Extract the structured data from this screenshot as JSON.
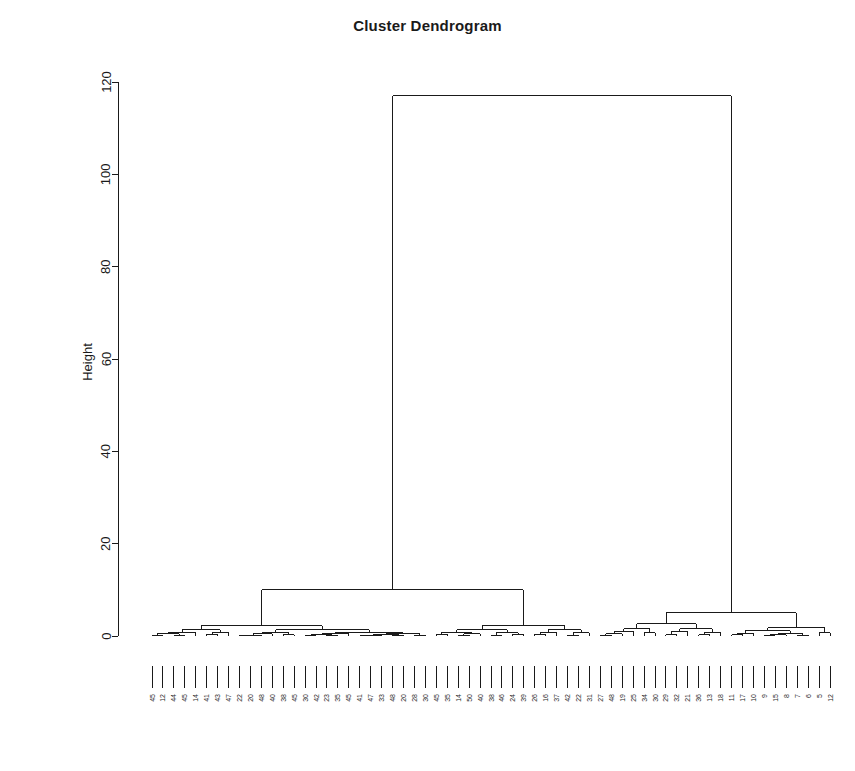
{
  "chart_data": {
    "type": "dendrogram",
    "title": "Cluster Dendrogram",
    "xlabel": "",
    "ylabel": "Height",
    "ylim": [
      0,
      125
    ],
    "yticks": [
      0,
      20,
      40,
      60,
      80,
      100,
      120
    ],
    "ytick_labels": [
      "0",
      "20",
      "40",
      "60",
      "80",
      "100",
      "120"
    ],
    "grid": false,
    "legend": "none",
    "n_leaves": 63,
    "root_height": 117,
    "leaf_labels": [
      "45",
      "12",
      "44",
      "45",
      "14",
      "41",
      "43",
      "47",
      "22",
      "20",
      "48",
      "40",
      "38",
      "45",
      "30",
      "42",
      "23",
      "35",
      "45",
      "41",
      "47",
      "33",
      "48",
      "20",
      "28",
      "30",
      "45",
      "35",
      "14",
      "50",
      "40",
      "38",
      "46",
      "24",
      "39",
      "26",
      "16",
      "37",
      "42",
      "22",
      "31",
      "27",
      "48",
      "19",
      "25",
      "34",
      "30",
      "29",
      "32",
      "21",
      "36",
      "13",
      "18",
      "11",
      "17",
      "10",
      "9",
      "15",
      "8",
      "7",
      "6",
      "5",
      "12"
    ],
    "merges": [
      {
        "id": "root",
        "height": 117,
        "left": "L",
        "right": "R"
      },
      {
        "id": "L",
        "height": 10,
        "left": "L1",
        "right": "L2"
      },
      {
        "id": "R",
        "height": 5,
        "left": "R1",
        "right": "R2"
      },
      {
        "id": "L1",
        "height": 2,
        "left": "L1a",
        "right": "L1b"
      },
      {
        "id": "L2",
        "height": 1.5,
        "left": "L2a",
        "right": "L2b"
      },
      {
        "id": "R1",
        "height": 2.4,
        "left": "R1a",
        "right": "R1b"
      },
      {
        "id": "R2",
        "height": 1.0,
        "left": "R2a",
        "right": "R2b"
      }
    ],
    "clusters": [
      {
        "name": "left-cluster",
        "leaf_start": 0,
        "leaf_end": 40,
        "merge_height": 10
      },
      {
        "name": "right-cluster",
        "leaf_start": 41,
        "leaf_end": 62,
        "merge_height": 5
      }
    ]
  },
  "axes": {
    "y_axis_name": "height-axis",
    "x_baseline_name": "leaf-baseline"
  }
}
